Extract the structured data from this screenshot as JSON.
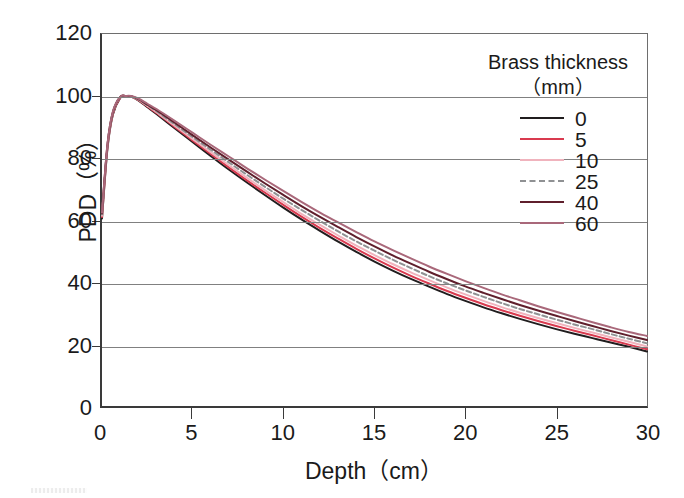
{
  "chart_data": {
    "type": "line",
    "title": "",
    "xlabel": "Depth（cm）",
    "ylabel": "PDD（%）",
    "xlim": [
      0,
      30
    ],
    "ylim": [
      0,
      120
    ],
    "xticks": [
      0,
      5,
      10,
      15,
      20,
      25,
      30
    ],
    "yticks": [
      0,
      20,
      40,
      60,
      80,
      100,
      120
    ],
    "gridlines": {
      "horizontal": [
        20,
        40,
        60,
        80,
        100
      ],
      "vertical": []
    },
    "legend": {
      "position": "top-right-inside",
      "title_line1": "Brass thickness",
      "title_line2": "（mm）"
    },
    "x": [
      0,
      0.3,
      0.6,
      1.0,
      1.3,
      1.6,
      2.0,
      2.5,
      3,
      4,
      5,
      6,
      7,
      8,
      9,
      10,
      11,
      12,
      13,
      14,
      15,
      16,
      17,
      18,
      19,
      20,
      21,
      22,
      23,
      24,
      25,
      26,
      27,
      28,
      29,
      30
    ],
    "series": [
      {
        "name": "0",
        "label": "0",
        "color": "#201d1e",
        "dash": "none",
        "values": [
          60.5,
          83.0,
          94.0,
          99.4,
          100.0,
          99.8,
          98.6,
          96.4,
          94.2,
          89.6,
          85.1,
          80.6,
          76.2,
          72.0,
          67.9,
          63.9,
          60.1,
          56.5,
          53.0,
          49.7,
          46.6,
          43.7,
          41.0,
          38.5,
          36.1,
          33.9,
          31.8,
          29.9,
          28.1,
          26.4,
          24.8,
          23.3,
          21.9,
          20.5,
          19.1,
          17.6
        ]
      },
      {
        "name": "5",
        "label": "5",
        "color": "#d93a4f",
        "dash": "none",
        "values": [
          61.0,
          83.5,
          94.3,
          99.5,
          100.0,
          99.8,
          98.7,
          96.6,
          94.5,
          90.0,
          85.6,
          81.2,
          76.9,
          72.7,
          68.7,
          64.8,
          61.0,
          57.4,
          54.0,
          50.7,
          47.6,
          44.7,
          42.0,
          39.5,
          37.1,
          34.9,
          32.8,
          30.9,
          29.1,
          27.4,
          25.8,
          24.3,
          22.8,
          21.3,
          19.8,
          18.3
        ]
      },
      {
        "name": "10",
        "label": "10",
        "color": "#f0b3bd",
        "dash": "none",
        "values": [
          61.4,
          83.8,
          94.5,
          99.6,
          100.0,
          99.9,
          98.8,
          96.8,
          94.8,
          90.4,
          86.1,
          81.8,
          77.6,
          73.5,
          69.5,
          65.7,
          61.9,
          58.4,
          55.0,
          51.7,
          48.7,
          45.8,
          43.1,
          40.6,
          38.2,
          36.0,
          33.9,
          31.9,
          30.1,
          28.4,
          26.8,
          25.2,
          23.7,
          22.2,
          20.7,
          19.2
        ]
      },
      {
        "name": "25",
        "label": "25",
        "color": "#8f9193",
        "dash": "dashed",
        "values": [
          61.8,
          84.0,
          94.7,
          99.6,
          100.0,
          99.9,
          98.9,
          97.0,
          95.1,
          90.9,
          86.7,
          82.6,
          78.5,
          74.5,
          70.6,
          66.8,
          63.2,
          59.7,
          56.3,
          53.1,
          50.1,
          47.2,
          44.5,
          41.9,
          39.5,
          37.3,
          35.2,
          33.2,
          31.3,
          29.6,
          27.9,
          26.3,
          24.8,
          23.2,
          21.7,
          20.2
        ]
      },
      {
        "name": "40",
        "label": "40",
        "color": "#5f1f2c",
        "dash": "none",
        "values": [
          62.1,
          84.2,
          94.8,
          99.7,
          100.0,
          99.9,
          99.0,
          97.2,
          95.4,
          91.4,
          87.3,
          83.3,
          79.4,
          75.5,
          71.7,
          68.0,
          64.4,
          61.0,
          57.7,
          54.5,
          51.5,
          48.6,
          45.9,
          43.3,
          40.9,
          38.6,
          36.5,
          34.5,
          32.6,
          30.8,
          29.1,
          27.4,
          25.8,
          24.2,
          22.7,
          21.3
        ]
      },
      {
        "name": "60",
        "label": "60",
        "color": "#a9687a",
        "dash": "none",
        "values": [
          62.4,
          84.4,
          95.0,
          99.7,
          100.0,
          100.0,
          99.2,
          97.5,
          95.8,
          92.0,
          88.1,
          84.2,
          80.4,
          76.6,
          72.9,
          69.3,
          65.8,
          62.4,
          59.2,
          56.1,
          53.1,
          50.3,
          47.6,
          45.0,
          42.6,
          40.3,
          38.1,
          36.0,
          34.1,
          32.2,
          30.4,
          28.7,
          27.0,
          25.4,
          23.9,
          22.6
        ]
      }
    ]
  }
}
